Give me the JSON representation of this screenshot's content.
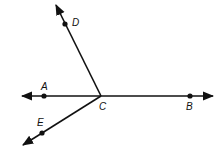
{
  "diagram": {
    "type": "geometry-rays",
    "vertex": {
      "label": "C",
      "x": 101,
      "y": 96
    },
    "points": [
      {
        "label": "A",
        "x": 44,
        "y": 96
      },
      {
        "label": "B",
        "x": 190,
        "y": 96
      },
      {
        "label": "D",
        "x": 65,
        "y": 24
      },
      {
        "label": "E",
        "x": 42,
        "y": 133
      }
    ],
    "labels": {
      "A": "A",
      "B": "B",
      "C": "C",
      "D": "D",
      "E": "E"
    },
    "line_color": "#111111"
  }
}
